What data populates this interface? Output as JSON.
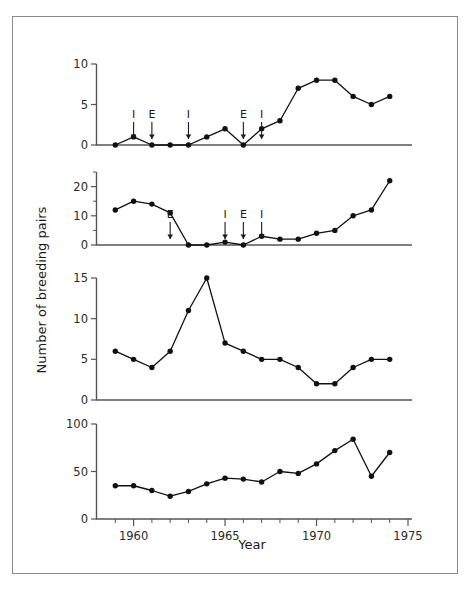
{
  "figure": {
    "xlabel": "Year",
    "ylabel": "Number of breeding pairs"
  },
  "chart_data": [
    {
      "type": "line",
      "panel": 1,
      "title": "",
      "xlabel": "",
      "ylabel": "Number of breeding pairs",
      "xlim": [
        1958,
        1975
      ],
      "ylim": [
        0,
        10
      ],
      "yticks": [
        0,
        5,
        10
      ],
      "ytick_labels": [
        "0",
        "5",
        "10"
      ],
      "grid": false,
      "legend": "none",
      "x": [
        1959,
        1960,
        1961,
        1962,
        1963,
        1964,
        1965,
        1966,
        1967,
        1968,
        1969,
        1970,
        1971,
        1972,
        1973,
        1974
      ],
      "values": [
        0,
        1,
        0,
        0,
        0,
        1,
        2,
        0,
        2,
        3,
        7,
        8,
        8,
        6,
        5,
        6
      ],
      "annotations": [
        {
          "label": "I",
          "year": 1960
        },
        {
          "label": "E",
          "year": 1961
        },
        {
          "label": "I",
          "year": 1963
        },
        {
          "label": "E",
          "year": 1966
        },
        {
          "label": "I",
          "year": 1967
        }
      ]
    },
    {
      "type": "line",
      "panel": 2,
      "title": "",
      "xlabel": "",
      "ylabel": "Number of breeding pairs",
      "xlim": [
        1958,
        1975
      ],
      "ylim": [
        0,
        25
      ],
      "yticks": [
        0,
        10,
        20
      ],
      "ytick_labels": [
        "0",
        "10",
        "20"
      ],
      "yticks_minor": [
        5,
        15,
        25
      ],
      "grid": false,
      "legend": "none",
      "x": [
        1959,
        1960,
        1961,
        1962,
        1963,
        1964,
        1965,
        1966,
        1967,
        1968,
        1969,
        1970,
        1971,
        1972,
        1973,
        1974
      ],
      "values": [
        12,
        15,
        14,
        11,
        0,
        0,
        1,
        0,
        3,
        2,
        2,
        4,
        5,
        10,
        12,
        22
      ],
      "annotations": [
        {
          "label": "E",
          "year": 1962
        },
        {
          "label": "I",
          "year": 1965
        },
        {
          "label": "E",
          "year": 1966
        },
        {
          "label": "I",
          "year": 1967
        }
      ]
    },
    {
      "type": "line",
      "panel": 3,
      "title": "",
      "xlabel": "",
      "ylabel": "Number of breeding pairs",
      "xlim": [
        1958,
        1975
      ],
      "ylim": [
        0,
        15
      ],
      "yticks": [
        0,
        5,
        10,
        15
      ],
      "ytick_labels": [
        "0",
        "5",
        "10",
        "15"
      ],
      "grid": false,
      "legend": "none",
      "x": [
        1959,
        1960,
        1961,
        1962,
        1963,
        1964,
        1965,
        1966,
        1967,
        1968,
        1969,
        1970,
        1971,
        1972,
        1973,
        1974
      ],
      "values": [
        6,
        5,
        4,
        6,
        11,
        15,
        7,
        6,
        5,
        5,
        4,
        2,
        2,
        4,
        5,
        5
      ],
      "annotations": []
    },
    {
      "type": "line",
      "panel": 4,
      "title": "",
      "xlabel": "Year",
      "ylabel": "Number of breeding pairs",
      "xlim": [
        1958,
        1975
      ],
      "ylim": [
        0,
        100
      ],
      "yticks": [
        0,
        50,
        100
      ],
      "ytick_labels": [
        "0",
        "50",
        "100"
      ],
      "xticks": [
        1960,
        1965,
        1970,
        1975
      ],
      "xtick_labels": [
        "1960",
        "1965",
        "1970",
        "1975"
      ],
      "grid": false,
      "legend": "none",
      "x": [
        1959,
        1960,
        1961,
        1962,
        1963,
        1964,
        1965,
        1966,
        1967,
        1968,
        1969,
        1970,
        1971,
        1972,
        1973,
        1974
      ],
      "values": [
        35,
        35,
        30,
        24,
        29,
        37,
        43,
        42,
        39,
        50,
        48,
        58,
        72,
        84,
        45,
        70
      ],
      "annotations": []
    }
  ]
}
